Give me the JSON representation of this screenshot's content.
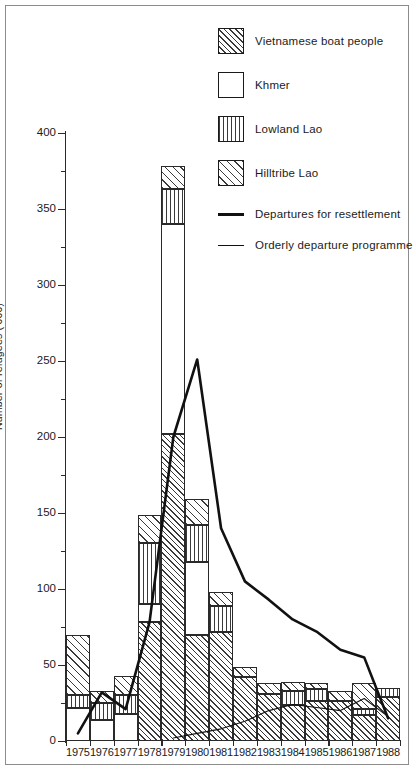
{
  "legend": {
    "items": [
      {
        "label": "Vietnamese boat people",
        "pattern": "diagonal-hatch-dense",
        "key": "viet"
      },
      {
        "label": "Khmer",
        "pattern": "solid-white",
        "key": "khmer"
      },
      {
        "label": "Lowland Lao",
        "pattern": "vertical-hatch",
        "key": "lowland"
      },
      {
        "label": "Hilltribe Lao",
        "pattern": "diagonal-hatch-wide",
        "key": "hill"
      }
    ],
    "lines": [
      {
        "label": "Departures for resettlement",
        "style": "thick"
      },
      {
        "label": "Orderly departure programme",
        "style": "thin"
      }
    ]
  },
  "chart_data": {
    "type": "bar",
    "title": "",
    "xlabel": "",
    "ylabel": "Number of refugees ('000)",
    "ylim": [
      0,
      400
    ],
    "ytick_major": [
      0,
      50,
      100,
      150,
      200,
      250,
      300,
      350,
      400
    ],
    "ytick_minor_step": 25,
    "grid": false,
    "stacked": true,
    "legend_position": "top-right",
    "categories": [
      "1975",
      "1976",
      "1977",
      "1978",
      "1979",
      "1980",
      "1981",
      "1982",
      "1983",
      "1984",
      "1985",
      "1986",
      "1987",
      "1988"
    ],
    "series": [
      {
        "name": "Vietnamese boat people",
        "key": "viet",
        "values": [
          0,
          0,
          0,
          78,
          202,
          70,
          72,
          42,
          31,
          24,
          26,
          26,
          17,
          29
        ]
      },
      {
        "name": "Khmer",
        "key": "khmer",
        "values": [
          22,
          14,
          18,
          12,
          138,
          48,
          0,
          0,
          0,
          0,
          0,
          0,
          0,
          0
        ]
      },
      {
        "name": "Lowland Lao",
        "key": "lowland",
        "values": [
          8,
          11,
          12,
          40,
          23,
          24,
          17,
          0,
          0,
          9,
          8,
          0,
          4,
          6
        ]
      },
      {
        "name": "Hilltribe Lao",
        "key": "hill",
        "values": [
          40,
          8,
          13,
          19,
          15,
          17,
          9,
          7,
          7,
          6,
          4,
          7,
          17,
          0
        ]
      }
    ],
    "bar_totals": [
      70,
      41,
      43,
      149,
      378,
      159,
      98,
      49,
      38,
      39,
      38,
      33,
      38,
      35
    ],
    "lines": [
      {
        "name": "Departures for resettlement",
        "style": "thick",
        "x": [
          "1975",
          "1976",
          "1977",
          "1978",
          "1979",
          "1980",
          "1981",
          "1982",
          "1983",
          "1984",
          "1985",
          "1986",
          "1987",
          "1988"
        ],
        "values": [
          5,
          32,
          21,
          78,
          200,
          251,
          140,
          105,
          93,
          80,
          72,
          60,
          55,
          15
        ]
      },
      {
        "name": "Orderly departure programme",
        "style": "thin",
        "x": [
          "1979",
          "1980",
          "1981",
          "1982",
          "1983",
          "1984",
          "1985",
          "1986",
          "1987",
          "1988"
        ],
        "values": [
          2,
          5,
          8,
          13,
          20,
          24,
          22,
          20,
          28,
          16
        ]
      }
    ]
  }
}
